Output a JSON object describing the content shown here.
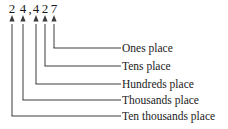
{
  "figure": {
    "number_text": "2 4, 4 2 7",
    "ink_color": "#1a1a1a",
    "line_color": "#3c3c3c",
    "background_color": "#ffffff",
    "digits": [
      {
        "char": "2",
        "x": 12,
        "place": "ten thousands"
      },
      {
        "char": "4",
        "x": 23,
        "place": "thousands"
      },
      {
        "char": ",",
        "x": 30,
        "place": "group separator"
      },
      {
        "char": "4",
        "x": 36,
        "place": "hundreds"
      },
      {
        "char": "2",
        "x": 45,
        "place": "tens"
      },
      {
        "char": "7",
        "x": 54,
        "place": "ones"
      }
    ],
    "arrows": [
      {
        "index": 1,
        "x": 12,
        "tip_y": 19,
        "turn_y": 116,
        "label": "Ten thousands place"
      },
      {
        "index": 2,
        "x": 23,
        "tip_y": 19,
        "turn_y": 100,
        "label": "Thousands place"
      },
      {
        "index": 3,
        "x": 36,
        "tip_y": 19,
        "turn_y": 84,
        "label": "Hundreds place"
      },
      {
        "index": 4,
        "x": 45,
        "tip_y": 19,
        "turn_y": 66,
        "label": "Tens place"
      },
      {
        "index": 5,
        "x": 54,
        "tip_y": 19,
        "turn_y": 48,
        "label": "Ones place"
      }
    ],
    "labels": [
      {
        "text": "Ones place",
        "x": 122,
        "y": 42,
        "line_y": 48,
        "line_from_x": 54
      },
      {
        "text": "Tens place",
        "x": 122,
        "y": 60,
        "line_y": 66,
        "line_from_x": 45
      },
      {
        "text": "Hundreds place",
        "x": 122,
        "y": 78,
        "line_y": 84,
        "line_from_x": 36
      },
      {
        "text": "Thousands place",
        "x": 122,
        "y": 94,
        "line_y": 100,
        "line_from_x": 23
      },
      {
        "text": "Ten thousands place",
        "x": 122,
        "y": 110,
        "line_y": 116,
        "line_from_x": 12
      }
    ],
    "label_line_end_x": 121
  }
}
